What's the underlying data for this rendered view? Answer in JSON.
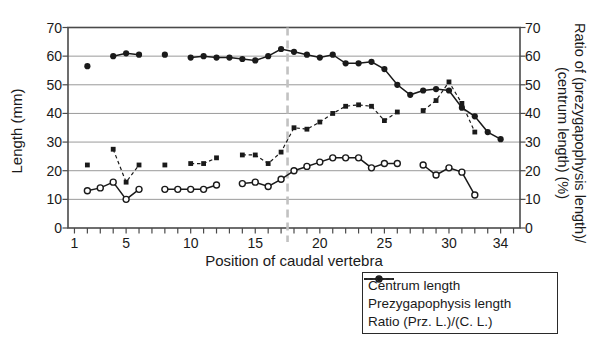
{
  "figure": {
    "x_axis_title": "Position of caudal vertebra",
    "y_left_title": "Length (mm)",
    "y_right_title_line1": "Ratio of (prezygapophysis length)/",
    "y_right_title_line2": "(centrum length) (%)"
  },
  "legend": {
    "items": [
      {
        "label": "Centrum length",
        "marker": "filled-circle-solid-line"
      },
      {
        "label": "Prezygapophysis length",
        "marker": "open-circle-solid-line"
      },
      {
        "label": "Ratio (Prz. L.)/(C. L.)",
        "marker": "filled-dot-dashed-line"
      }
    ]
  },
  "colors": {
    "ink": "#1a1a1a",
    "grid": "#9a9a9a",
    "frame": "#4a4a4a",
    "divider_line": "#c2c2c2",
    "background": "#ffffff"
  },
  "chart_data": {
    "type": "line",
    "title": "",
    "xlabel": "Position of caudal vertebra",
    "ylabel_left": "Length (mm)",
    "ylabel_right": "Ratio of (prezygapophysis length)/(centrum length) (%)",
    "xlim": [
      0.5,
      35.5
    ],
    "ylim_left": [
      0,
      70
    ],
    "ylim_right": [
      0,
      70
    ],
    "x_labeled_ticks": [
      1,
      5,
      10,
      15,
      20,
      25,
      30,
      34
    ],
    "x_minor_tick_step": 1,
    "x_minor_tick_range": [
      1,
      35
    ],
    "y_ticks": [
      0,
      10,
      20,
      30,
      40,
      50,
      60,
      70
    ],
    "gridlines_y": [
      10,
      20,
      30,
      40,
      50,
      60
    ],
    "grid": "horizontal-only",
    "vertical_dashed_marker_x": 17.5,
    "legend_position": "below-right",
    "series": [
      {
        "name": "Centrum length",
        "axis": "left",
        "marker": "filled-circle",
        "line": "solid",
        "points": [
          [
            2,
            56.5
          ],
          [
            4,
            60
          ],
          [
            5,
            61
          ],
          [
            6,
            60.5
          ],
          [
            8,
            60.5
          ],
          [
            10,
            59.5
          ],
          [
            11,
            60
          ],
          [
            12,
            59.5
          ],
          [
            13,
            59.5
          ],
          [
            14,
            59
          ],
          [
            15,
            58.5
          ],
          [
            16,
            60
          ],
          [
            17,
            62.5
          ],
          [
            18,
            61.5
          ],
          [
            19,
            60.5
          ],
          [
            20,
            59.5
          ],
          [
            21,
            60.5
          ],
          [
            22,
            57.5
          ],
          [
            23,
            57.5
          ],
          [
            24,
            58
          ],
          [
            25,
            55.5
          ],
          [
            26,
            50
          ],
          [
            27,
            46.5
          ],
          [
            28,
            48
          ],
          [
            29,
            48.5
          ],
          [
            30,
            48
          ],
          [
            31,
            42
          ],
          [
            32,
            39
          ],
          [
            33,
            33.5
          ],
          [
            34,
            31
          ]
        ]
      },
      {
        "name": "Prezygapophysis length",
        "axis": "left",
        "marker": "open-circle",
        "line": "solid",
        "points": [
          [
            2,
            13
          ],
          [
            3,
            14
          ],
          [
            4,
            16
          ],
          [
            5,
            10
          ],
          [
            6,
            13.5
          ],
          [
            8,
            13.5
          ],
          [
            9,
            13.5
          ],
          [
            10,
            13.5
          ],
          [
            11,
            13.5
          ],
          [
            12,
            15
          ],
          [
            14,
            15.5
          ],
          [
            15,
            16
          ],
          [
            16,
            14.5
          ],
          [
            17,
            17
          ],
          [
            18,
            20
          ],
          [
            19,
            21.5
          ],
          [
            20,
            23
          ],
          [
            21,
            24.5
          ],
          [
            22,
            24.5
          ],
          [
            23,
            24.5
          ],
          [
            24,
            21
          ],
          [
            25,
            22.5
          ],
          [
            26,
            22.5
          ],
          [
            28,
            22
          ],
          [
            29,
            18.5
          ],
          [
            30,
            21
          ],
          [
            31,
            19.5
          ],
          [
            32,
            11.5
          ]
        ]
      },
      {
        "name": "Ratio (Prz. L.)/(C. L.)",
        "axis": "right",
        "marker": "filled-square",
        "line": "dashed",
        "points": [
          [
            2,
            22
          ],
          [
            4,
            27.5
          ],
          [
            5,
            16
          ],
          [
            6,
            22
          ],
          [
            8,
            22
          ],
          [
            10,
            22.5
          ],
          [
            11,
            22.5
          ],
          [
            12,
            24.5
          ],
          [
            14,
            25.5
          ],
          [
            15,
            25.5
          ],
          [
            16,
            22.5
          ],
          [
            17,
            26.5
          ],
          [
            18,
            35
          ],
          [
            19,
            34.5
          ],
          [
            20,
            37
          ],
          [
            21,
            40
          ],
          [
            22,
            42.5
          ],
          [
            23,
            43
          ],
          [
            24,
            42.5
          ],
          [
            25,
            37.5
          ],
          [
            26,
            40.5
          ],
          [
            28,
            41
          ],
          [
            29,
            44.5
          ],
          [
            30,
            51
          ],
          [
            31,
            43.5
          ],
          [
            32,
            33.5
          ]
        ]
      }
    ]
  }
}
